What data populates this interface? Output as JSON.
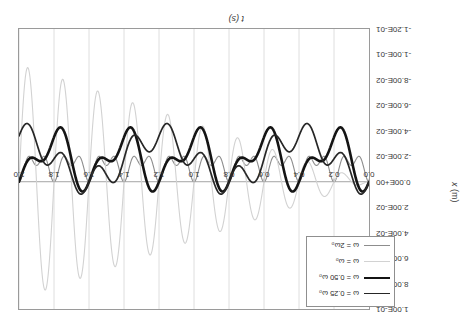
{
  "chart_data": {
    "type": "line",
    "title": "",
    "xlabel": "t (s)",
    "ylabel": "x (m)",
    "xlim": [
      0.0,
      2.0
    ],
    "ylim": [
      -0.12,
      0.1
    ],
    "grid": "vertical",
    "legend_position": "bottom-right",
    "xticks": [
      "0.0",
      "0.2",
      "0.4",
      "0.6",
      "0.8",
      "1.0",
      "1.2",
      "1.4",
      "1.6",
      "1.8",
      "2.0"
    ],
    "ytick_labels": [
      "-1.20E-01",
      "-1.00E-01",
      "-8.00E-02",
      "-6.00E-02",
      "-4.00E-02",
      "-2.00E-02",
      "0.00E+00",
      "2.00E-02",
      "4.00E-02",
      "6.00E-02",
      "8.00E-02",
      "1.00E-01"
    ],
    "ytick_values": [
      -0.12,
      -0.1,
      -0.08,
      -0.06,
      -0.04,
      -0.02,
      0.0,
      0.02,
      0.04,
      0.06,
      0.08,
      0.1
    ],
    "series": [
      {
        "name": "ω = 2ω₀",
        "color": "#8d8d8d",
        "width": 1.1,
        "omega_ratio": 2.0,
        "amplitude": 0.0042,
        "offset": -0.0128,
        "points_t": [
          0.0,
          0.05,
          0.1,
          0.15,
          0.2,
          0.25,
          0.3,
          0.35,
          0.4,
          0.45,
          0.5,
          0.6,
          0.7,
          0.8,
          0.9,
          1.0,
          1.1,
          1.2,
          1.3,
          1.4,
          1.5,
          1.6,
          1.7,
          1.8,
          1.9,
          2.0
        ],
        "points_x": [
          0.0,
          -0.0085,
          -0.0128,
          -0.0171,
          -0.0085,
          -0.0128,
          -0.0171,
          -0.0085,
          -0.0128,
          -0.0171,
          -0.0085,
          -0.0171,
          -0.0085,
          -0.0171,
          -0.0085,
          -0.0171,
          -0.0085,
          -0.0171,
          -0.0085,
          -0.0171,
          -0.0085,
          -0.0171,
          -0.0085,
          -0.0171,
          -0.0085,
          -0.0128
        ]
      },
      {
        "name": "ω = ω₀",
        "color": "#d2d2d2",
        "width": 1.1,
        "omega_ratio": 1.0,
        "resonant": true,
        "growth_to": 0.092,
        "points_t": [
          0.0,
          0.1,
          0.2,
          0.3,
          0.4,
          0.5,
          0.6,
          0.7,
          0.8,
          0.9,
          1.0,
          1.1,
          1.2,
          1.3,
          1.4,
          1.5,
          1.6,
          1.7,
          1.8,
          1.9,
          2.0
        ],
        "points_x": [
          0.0,
          -0.013,
          0.022,
          -0.035,
          0.043,
          -0.05,
          0.056,
          -0.062,
          0.066,
          -0.07,
          0.074,
          -0.078,
          0.081,
          -0.083,
          0.086,
          -0.088,
          0.089,
          -0.09,
          0.091,
          -0.092,
          0.092
        ]
      },
      {
        "name": "ω = 0.50 ω₀",
        "color": "#141414",
        "width": 2.6,
        "omega_ratio": 0.5,
        "amplitude": 0.021,
        "offset": -0.0175,
        "points_t": [
          0.0,
          0.1,
          0.2,
          0.3,
          0.4,
          0.5,
          0.6,
          0.7,
          0.8,
          0.9,
          1.0,
          1.1,
          1.2,
          1.3,
          1.4,
          1.5,
          1.6,
          1.7,
          1.8,
          1.9,
          2.0
        ],
        "points_x": [
          0.0,
          -0.05,
          0.018,
          -0.042,
          0.003,
          -0.038,
          0.01,
          -0.04,
          0.006,
          -0.039,
          0.008,
          -0.039,
          0.007,
          -0.039,
          0.0,
          -0.036,
          0.008,
          -0.038,
          0.004,
          -0.037,
          -0.012
        ]
      },
      {
        "name": "ω = 0.25 ω₀",
        "color": "#262626",
        "width": 1.7,
        "omega_ratio": 0.25,
        "amplitude": 0.02,
        "offset": -0.018,
        "points_t": [
          0.0,
          0.1,
          0.2,
          0.3,
          0.4,
          0.5,
          0.6,
          0.7,
          0.8,
          0.9,
          1.0,
          1.1,
          1.2,
          1.3,
          1.4,
          1.5,
          1.6,
          1.7,
          1.8,
          1.9,
          2.0
        ],
        "points_x": [
          0.0,
          -0.052,
          -0.006,
          -0.03,
          -0.022,
          -0.035,
          -0.002,
          -0.035,
          -0.036,
          -0.004,
          -0.036,
          -0.034,
          -0.002,
          -0.034,
          -0.034,
          -0.001,
          -0.034,
          -0.032,
          -0.006,
          -0.03,
          -0.014
        ]
      }
    ]
  },
  "axes": {
    "x_title": "t (s)",
    "y_title_var": "x",
    "y_title_unit": "(m)",
    "xticks": [
      "0.0",
      "0.2",
      "0.4",
      "0.6",
      "0.8",
      "1.0",
      "1.2",
      "1.4",
      "1.6",
      "1.8",
      "2.0"
    ],
    "yticks": [
      "-1.20E-01",
      "-1.00E-01",
      "-8.00E-02",
      "-6.00E-02",
      "-4.00E-02",
      "-2.00E-02",
      "0.00E+00",
      "2.00E-02",
      "4.00E-02",
      "6.00E-02",
      "8.00E-02",
      "1.00E-01"
    ]
  },
  "legend": {
    "items": [
      {
        "label": "ω = 0.25 ω₀",
        "swatch": "sw-d"
      },
      {
        "label": "ω = 0.50 ω₀",
        "swatch": "sw-c"
      },
      {
        "label": "ω = ω₀",
        "swatch": "sw-b"
      },
      {
        "label": "ω = 2ω₀",
        "swatch": "sw-a"
      }
    ]
  }
}
